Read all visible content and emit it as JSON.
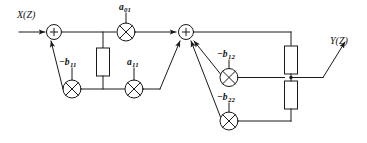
{
  "diagram": {
    "stroke_color": "#1a1a1a",
    "background": "#ffffff",
    "input_label": "X(Z)",
    "output_label": "Y(Z)",
    "summer_symbol": "+",
    "nodes": {
      "summer_1": {
        "name": "first-summing-junction",
        "symbol": "+"
      },
      "summer_2": {
        "name": "second-summing-junction",
        "symbol": "+"
      }
    },
    "coefficients": {
      "a01": {
        "base": "a",
        "sub": "01",
        "sign": ""
      },
      "a11": {
        "base": "a",
        "sub": "11",
        "sign": ""
      },
      "b11": {
        "base": "b",
        "sub": "11",
        "sign": "−"
      },
      "b12": {
        "base": "b",
        "sub": "12",
        "sign": "−"
      },
      "b22": {
        "base": "b",
        "sub": "22",
        "sign": "−"
      }
    },
    "multipliers": [
      {
        "id": "a01",
        "label_sign": "",
        "label_base": "a",
        "label_sub": "01"
      },
      {
        "id": "a11",
        "label_sign": "",
        "label_base": "a",
        "label_sub": "11"
      },
      {
        "id": "b11",
        "label_sign": "−",
        "label_base": "b",
        "label_sub": "11"
      },
      {
        "id": "b12",
        "label_sign": "−",
        "label_base": "b",
        "label_sub": "12"
      },
      {
        "id": "b22",
        "label_sign": "−",
        "label_base": "b",
        "label_sub": "22"
      }
    ],
    "delay_blocks": [
      {
        "id": "delay-left",
        "label": ""
      },
      {
        "id": "delay-right-upper",
        "label": ""
      },
      {
        "id": "delay-right-lower",
        "label": ""
      }
    ]
  }
}
